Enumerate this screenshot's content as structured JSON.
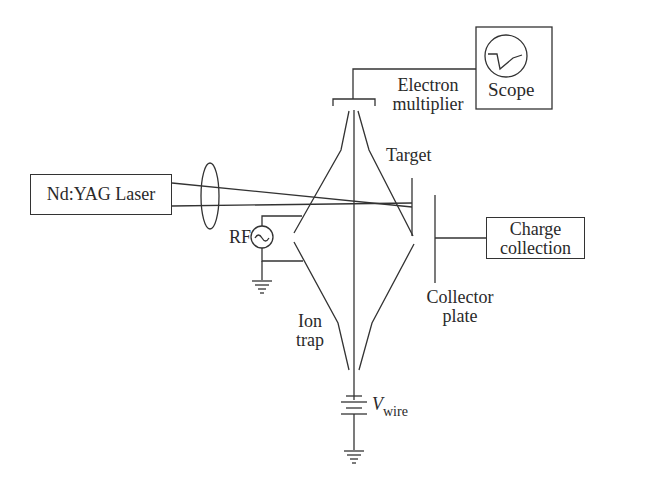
{
  "diagram": {
    "components": {
      "laser": {
        "label": "Nd:YAG Laser"
      },
      "scope": {
        "label": "Scope"
      },
      "electron_multiplier": {
        "line1": "Electron",
        "line2": "multiplier"
      },
      "target": {
        "label": "Target"
      },
      "charge_collection": {
        "line1": "Charge",
        "line2": "collection"
      },
      "collector_plate": {
        "line1": "Collector",
        "line2": "plate"
      },
      "rf_source": {
        "label": "RF",
        "symbol": "~"
      },
      "ion_trap": {
        "line1": "Ion",
        "line2": "trap"
      },
      "wire_voltage": {
        "symbol": "V",
        "subscript": "wire"
      }
    },
    "colors": {
      "line": "#333333",
      "background": "#ffffff"
    }
  }
}
